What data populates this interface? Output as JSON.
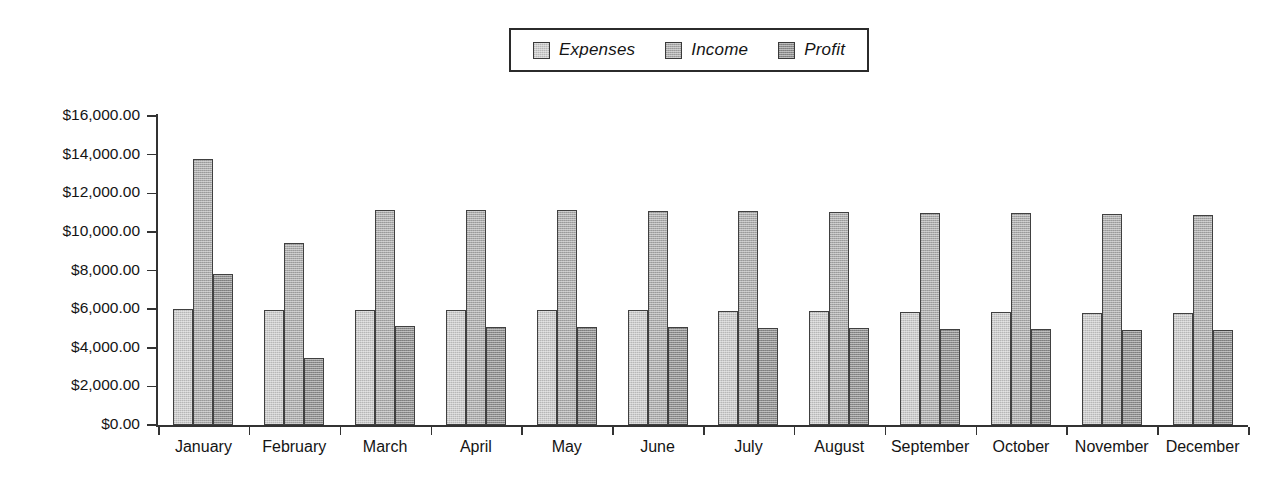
{
  "chart_data": {
    "type": "bar",
    "title": "",
    "xlabel": "",
    "ylabel": "",
    "grid": false,
    "legend_position": "top-center",
    "orientation": "vertical",
    "grouping": "grouped",
    "categories": [
      "January",
      "February",
      "March",
      "April",
      "May",
      "June",
      "July",
      "August",
      "September",
      "October",
      "November",
      "December"
    ],
    "ylim": [
      0,
      16000
    ],
    "ytick_values": [
      0,
      2000,
      4000,
      6000,
      8000,
      10000,
      12000,
      14000,
      16000
    ],
    "ytick_labels": [
      "$0.00",
      "$2,000.00",
      "$4,000.00",
      "$6,000.00",
      "$8,000.00",
      "$10,000.00",
      "$12,000.00",
      "$14,000.00",
      "$16,000.00"
    ],
    "series": [
      {
        "name": "Expenses",
        "color": "#cbcbcb",
        "values": [
          6000,
          5980,
          5970,
          5960,
          5940,
          5930,
          5910,
          5890,
          5860,
          5840,
          5810,
          5780
        ]
      },
      {
        "name": "Income",
        "color": "#ababab",
        "values": [
          13750,
          9450,
          11150,
          11130,
          11110,
          11090,
          11060,
          11030,
          11000,
          10980,
          10940,
          10900
        ]
      },
      {
        "name": "Profit",
        "color": "#8d8d8d",
        "values": [
          7800,
          3450,
          5120,
          5100,
          5080,
          5050,
          5020,
          5000,
          4970,
          4950,
          4920,
          4900
        ]
      }
    ]
  },
  "legend": {
    "items": [
      {
        "label": "Expenses",
        "swatch": "legend-swatch-expenses"
      },
      {
        "label": "Income",
        "swatch": "legend-swatch-income"
      },
      {
        "label": "Profit",
        "swatch": "legend-swatch-profit"
      }
    ]
  }
}
